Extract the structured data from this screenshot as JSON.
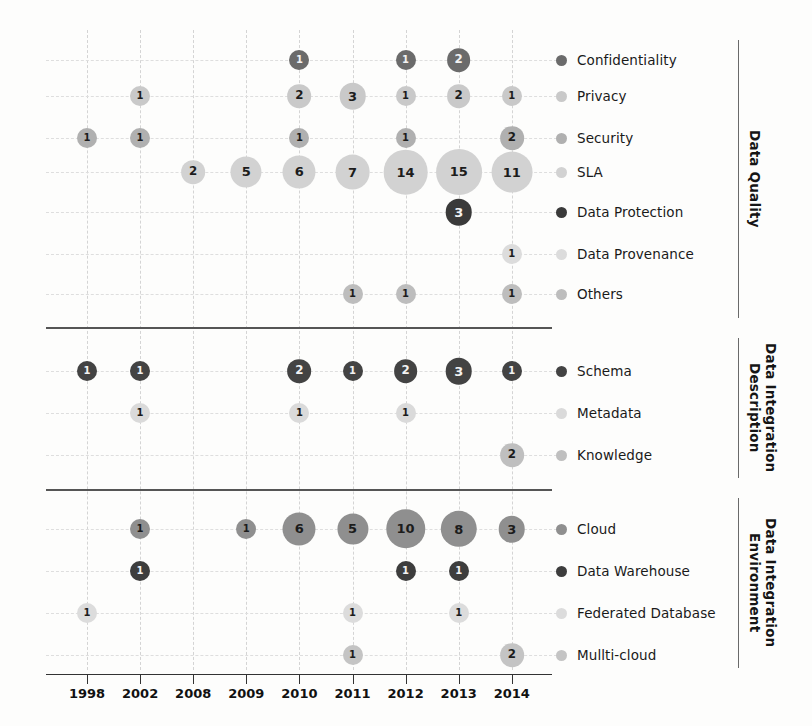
{
  "chart_data": {
    "type": "bubble",
    "title": "",
    "xlabel": "",
    "ylabel": "",
    "grid": true,
    "legend_position": "right",
    "x": [
      "1998",
      "2002",
      "2008",
      "2009",
      "2010",
      "2011",
      "2012",
      "2013",
      "2014"
    ],
    "groups": [
      {
        "name": "Data Quality",
        "series": [
          {
            "name": "Confidentiality",
            "color": "#6b6b6b",
            "points": [
              {
                "x": "2010",
                "v": 1
              },
              {
                "x": "2012",
                "v": 1
              },
              {
                "x": "2013",
                "v": 2
              }
            ]
          },
          {
            "name": "Privacy",
            "color": "#c9c9c9",
            "points": [
              {
                "x": "2002",
                "v": 1
              },
              {
                "x": "2010",
                "v": 2
              },
              {
                "x": "2011",
                "v": 3
              },
              {
                "x": "2012",
                "v": 1
              },
              {
                "x": "2013",
                "v": 2
              },
              {
                "x": "2014",
                "v": 1
              }
            ]
          },
          {
            "name": "Security",
            "color": "#b0b0b0",
            "points": [
              {
                "x": "1998",
                "v": 1
              },
              {
                "x": "2002",
                "v": 1
              },
              {
                "x": "2010",
                "v": 1
              },
              {
                "x": "2012",
                "v": 1
              },
              {
                "x": "2014",
                "v": 2
              }
            ]
          },
          {
            "name": "SLA",
            "color": "#d2d2d2",
            "points": [
              {
                "x": "2008",
                "v": 2
              },
              {
                "x": "2009",
                "v": 5
              },
              {
                "x": "2010",
                "v": 6
              },
              {
                "x": "2011",
                "v": 7
              },
              {
                "x": "2012",
                "v": 14
              },
              {
                "x": "2013",
                "v": 15
              },
              {
                "x": "2014",
                "v": 11
              }
            ]
          },
          {
            "name": "Data Protection",
            "color": "#3a3a3a",
            "points": [
              {
                "x": "2013",
                "v": 3
              }
            ]
          },
          {
            "name": "Data Provenance",
            "color": "#dcdcdc",
            "points": [
              {
                "x": "2014",
                "v": 1
              }
            ]
          },
          {
            "name": "Others",
            "color": "#bdbdbd",
            "points": [
              {
                "x": "2011",
                "v": 1
              },
              {
                "x": "2012",
                "v": 1
              },
              {
                "x": "2014",
                "v": 1
              }
            ]
          }
        ]
      },
      {
        "name": "Data Integration Description",
        "series": [
          {
            "name": "Schema",
            "color": "#434343",
            "points": [
              {
                "x": "1998",
                "v": 1
              },
              {
                "x": "2002",
                "v": 1
              },
              {
                "x": "2010",
                "v": 2
              },
              {
                "x": "2011",
                "v": 1
              },
              {
                "x": "2012",
                "v": 2
              },
              {
                "x": "2013",
                "v": 3
              },
              {
                "x": "2014",
                "v": 1
              }
            ]
          },
          {
            "name": "Metadata",
            "color": "#dadada",
            "points": [
              {
                "x": "2002",
                "v": 1
              },
              {
                "x": "2010",
                "v": 1
              },
              {
                "x": "2012",
                "v": 1
              }
            ]
          },
          {
            "name": "Knowledge",
            "color": "#bfbfbf",
            "points": [
              {
                "x": "2014",
                "v": 2
              }
            ]
          }
        ]
      },
      {
        "name": "Data Integration Environment",
        "series": [
          {
            "name": "Cloud",
            "color": "#8f8f8f",
            "points": [
              {
                "x": "2002",
                "v": 1
              },
              {
                "x": "2009",
                "v": 1
              },
              {
                "x": "2010",
                "v": 6
              },
              {
                "x": "2011",
                "v": 5
              },
              {
                "x": "2012",
                "v": 10
              },
              {
                "x": "2013",
                "v": 8
              },
              {
                "x": "2014",
                "v": 3
              }
            ]
          },
          {
            "name": "Data Warehouse",
            "color": "#3d3d3d",
            "points": [
              {
                "x": "2002",
                "v": 1
              },
              {
                "x": "2012",
                "v": 1
              },
              {
                "x": "2013",
                "v": 1
              }
            ]
          },
          {
            "name": "Federated Database",
            "color": "#dcdcdc",
            "points": [
              {
                "x": "1998",
                "v": 1
              },
              {
                "x": "2011",
                "v": 1
              },
              {
                "x": "2013",
                "v": 1
              }
            ]
          },
          {
            "name": "Mullti-cloud",
            "color": "#c4c4c4",
            "points": [
              {
                "x": "2011",
                "v": 1
              },
              {
                "x": "2014",
                "v": 2
              }
            ]
          }
        ]
      }
    ]
  }
}
